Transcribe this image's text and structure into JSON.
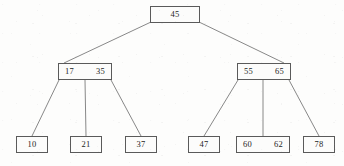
{
  "diagram": {
    "kind": "b-tree",
    "background_color": "#fdfdfc",
    "box_border_color": "#5a5a5a",
    "box_fill_color": "#fcfcfb",
    "edge_color": "#6a6a6a",
    "text_color": "#1d1d1d",
    "nodes": {
      "root": {
        "keys": [
          "45"
        ],
        "key_0": "45"
      },
      "internal_left": {
        "keys": [
          "17",
          "35"
        ],
        "key_0": "17",
        "key_1": "35"
      },
      "internal_right": {
        "keys": [
          "55",
          "65"
        ],
        "key_0": "55",
        "key_1": "65"
      },
      "leaf_1": {
        "keys": [
          "10"
        ],
        "key_0": "10"
      },
      "leaf_2": {
        "keys": [
          "21"
        ],
        "key_0": "21"
      },
      "leaf_3": {
        "keys": [
          "37"
        ],
        "key_0": "37"
      },
      "leaf_4": {
        "keys": [
          "47"
        ],
        "key_0": "47"
      },
      "leaf_5": {
        "keys": [
          "60",
          "62"
        ],
        "key_0": "60",
        "key_1": "62"
      },
      "leaf_6": {
        "keys": [
          "78"
        ],
        "key_0": "78"
      }
    },
    "edges": [
      {
        "from": "root",
        "to": "internal_left"
      },
      {
        "from": "root",
        "to": "internal_right"
      },
      {
        "from": "internal_left",
        "to": "leaf_1"
      },
      {
        "from": "internal_left",
        "to": "leaf_2"
      },
      {
        "from": "internal_left",
        "to": "leaf_3"
      },
      {
        "from": "internal_right",
        "to": "leaf_4"
      },
      {
        "from": "internal_right",
        "to": "leaf_5"
      },
      {
        "from": "internal_right",
        "to": "leaf_6"
      }
    ]
  }
}
